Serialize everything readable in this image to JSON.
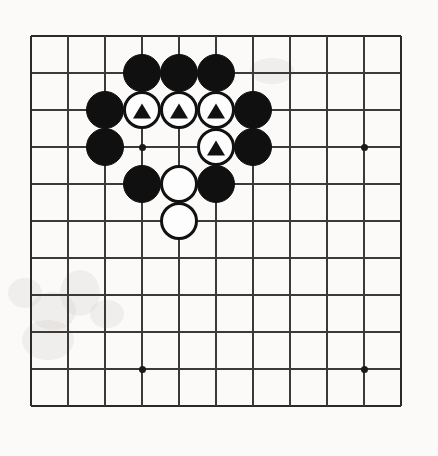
{
  "diagram": {
    "type": "go-board-problem-diagram",
    "board": {
      "visible_columns": 11,
      "visible_rows": 11,
      "grid_spacing_px": 37,
      "origin_x_px": 31,
      "origin_y_px": 36,
      "line_color": "#3a3a3a",
      "background_color": "#fbfaf8"
    },
    "star_points": [
      {
        "col": 3,
        "row": 3
      },
      {
        "col": 9,
        "row": 3
      },
      {
        "col": 3,
        "row": 9
      },
      {
        "col": 9,
        "row": 9
      }
    ],
    "stones": [
      {
        "col": 3,
        "row": 1,
        "color": "black",
        "mark": "none"
      },
      {
        "col": 4,
        "row": 1,
        "color": "black",
        "mark": "none"
      },
      {
        "col": 5,
        "row": 1,
        "color": "black",
        "mark": "none"
      },
      {
        "col": 2,
        "row": 2,
        "color": "black",
        "mark": "none"
      },
      {
        "col": 3,
        "row": 2,
        "color": "white",
        "mark": "triangle"
      },
      {
        "col": 4,
        "row": 2,
        "color": "white",
        "mark": "triangle"
      },
      {
        "col": 5,
        "row": 2,
        "color": "white",
        "mark": "triangle"
      },
      {
        "col": 6,
        "row": 2,
        "color": "black",
        "mark": "none"
      },
      {
        "col": 2,
        "row": 3,
        "color": "black",
        "mark": "none"
      },
      {
        "col": 5,
        "row": 3,
        "color": "white",
        "mark": "triangle"
      },
      {
        "col": 6,
        "row": 3,
        "color": "black",
        "mark": "none"
      },
      {
        "col": 3,
        "row": 4,
        "color": "black",
        "mark": "none"
      },
      {
        "col": 4,
        "row": 4,
        "color": "white",
        "mark": "none"
      },
      {
        "col": 5,
        "row": 4,
        "color": "black",
        "mark": "none"
      },
      {
        "col": 4,
        "row": 5,
        "color": "white",
        "mark": "none"
      }
    ],
    "counts": {
      "black_stones": 9,
      "white_stones": 6,
      "marked_white_stones": 4
    },
    "smudges": [
      {
        "x": 8,
        "y": 278,
        "w": 34,
        "h": 30
      },
      {
        "x": 30,
        "y": 292,
        "w": 46,
        "h": 38
      },
      {
        "x": 60,
        "y": 270,
        "w": 40,
        "h": 46
      },
      {
        "x": 22,
        "y": 320,
        "w": 52,
        "h": 40
      },
      {
        "x": 90,
        "y": 300,
        "w": 34,
        "h": 28
      },
      {
        "x": 250,
        "y": 58,
        "w": 44,
        "h": 26
      }
    ]
  }
}
